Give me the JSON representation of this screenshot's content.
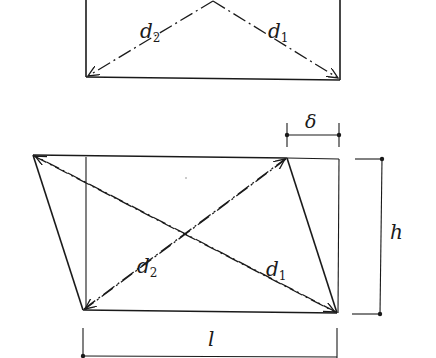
{
  "figure": {
    "top_diagram": {
      "description": "Undeformed rectangle with diagonals from apex",
      "labels": {
        "d2": {
          "main": "d",
          "sub": "2"
        },
        "d1": {
          "main": "d",
          "sub": "1"
        }
      }
    },
    "bottom_diagram": {
      "description": "Sheared parallelogram over original rectangle with diagonals",
      "labels": {
        "delta": "δ",
        "h": "h",
        "l": "l",
        "d2": {
          "main": "d",
          "sub": "2"
        },
        "d1": {
          "main": "d",
          "sub": "1"
        }
      }
    },
    "colors": {
      "ink": "#1a1a1a",
      "background": "#ffffff"
    }
  }
}
